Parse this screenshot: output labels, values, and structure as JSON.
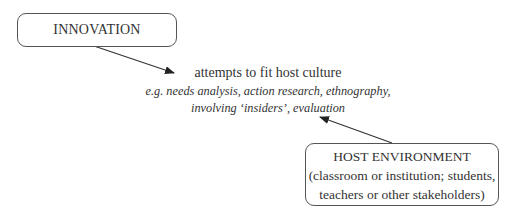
{
  "diagram": {
    "innovation_box": {
      "label": "INNOVATION"
    },
    "center_text": {
      "main": "attempts to fit host culture",
      "examples_line1": "e.g. needs analysis, action research, ethnography,",
      "examples_line2": "involving ‘insiders’, evaluation"
    },
    "host_box": {
      "title": "HOST ENVIRONMENT",
      "line2": "(classroom or institution; students,",
      "line3": "teachers or other stakeholders)"
    },
    "arrows": [
      {
        "from": "innovation_box",
        "to": "center_text"
      },
      {
        "from": "host_box",
        "to": "center_text"
      }
    ],
    "colors": {
      "line": "#333333",
      "text": "#333333",
      "border": "#555555"
    }
  }
}
